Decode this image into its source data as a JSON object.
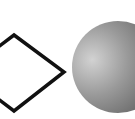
{
  "scene": {
    "background": "#ffffff",
    "shapes": [
      {
        "type": "diamond",
        "label": "outlined diamond",
        "fill": "none",
        "stroke": "#111111",
        "stroke_width": 3.5,
        "vertices": {
          "top": [
            14,
            35
          ],
          "right": [
            64,
            72
          ],
          "bottom": [
            14,
            111
          ],
          "left": [
            -36,
            73
          ]
        }
      },
      {
        "type": "sphere",
        "label": "shaded gray sphere",
        "center": [
          118,
          67
        ],
        "radius": 46,
        "highlight_color": "#d2d2d2",
        "mid_color": "#9a9a9a",
        "edge_color": "#5e5e5e",
        "highlight_center": [
          92,
          60
        ]
      }
    ]
  }
}
